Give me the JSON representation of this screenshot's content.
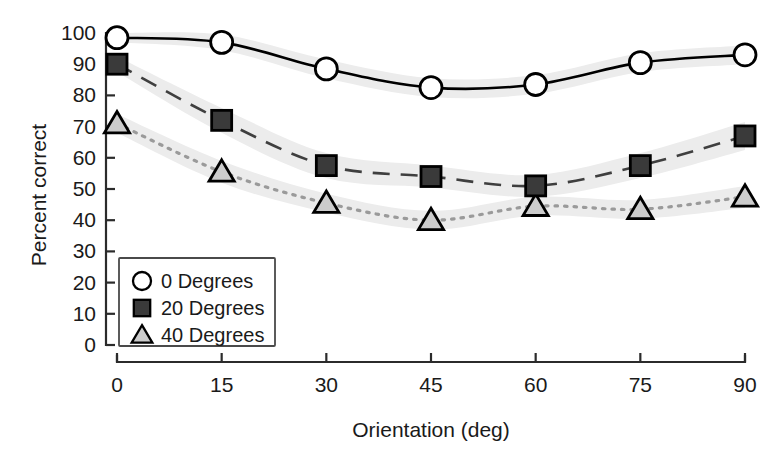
{
  "chart_data": {
    "type": "line",
    "title": "",
    "subtitle": "",
    "xlabel": "Orientation (deg)",
    "ylabel": "Percent correct",
    "x": [
      0,
      15,
      30,
      45,
      60,
      75,
      90
    ],
    "categories": [
      "0",
      "15",
      "30",
      "45",
      "60",
      "75",
      "90"
    ],
    "xticklabels": [
      "0",
      "15",
      "30",
      "45",
      "60",
      "75",
      "90"
    ],
    "yticklabels": [
      "0",
      "10",
      "20",
      "30",
      "40",
      "50",
      "60",
      "70",
      "80",
      "90",
      "100"
    ],
    "xlim": [
      0,
      90
    ],
    "ylim": [
      0,
      100
    ],
    "grid": false,
    "legend_position": "lower-left",
    "series": [
      {
        "name": "0 Degrees",
        "marker": "circle-open",
        "linestyle": "solid",
        "color": "#000000",
        "marker_fill": "#ffffff",
        "values": [
          98.5,
          97,
          88.5,
          82.5,
          83.5,
          90.5,
          93
        ],
        "band_upper": [
          100,
          99.5,
          91.5,
          85.5,
          86.5,
          93.5,
          96
        ],
        "band_lower": [
          97,
          94.5,
          85.5,
          79.5,
          80.5,
          87.5,
          90
        ]
      },
      {
        "name": "20 Degrees",
        "marker": "square-filled",
        "linestyle": "dashed",
        "color": "#3a3a3a",
        "marker_fill": "#3a3a3a",
        "values": [
          90,
          72,
          57.5,
          54,
          51,
          57.5,
          67
        ],
        "band_upper": [
          92.5,
          76,
          61.5,
          57.5,
          54.5,
          61.5,
          71.5
        ],
        "band_lower": [
          87.5,
          68,
          53.5,
          50.5,
          47.5,
          53.5,
          62.5
        ]
      },
      {
        "name": "40 Degrees",
        "marker": "triangle-filled",
        "linestyle": "dotted",
        "color": "#c8c8c8",
        "marker_fill": "#cccccc",
        "values": [
          71,
          55.5,
          45.5,
          40,
          44.5,
          43.5,
          47.5
        ],
        "band_upper": [
          74,
          59,
          48.5,
          43,
          47.5,
          46.5,
          51
        ],
        "band_lower": [
          68,
          52,
          42.5,
          37,
          41.5,
          40.5,
          44
        ]
      }
    ],
    "band_color": "#ececec",
    "legend": [
      {
        "label": "0 Degrees",
        "marker": "circle-open"
      },
      {
        "label": "20 Degrees",
        "marker": "square-filled"
      },
      {
        "label": "40 Degrees",
        "marker": "triangle-filled"
      }
    ]
  }
}
